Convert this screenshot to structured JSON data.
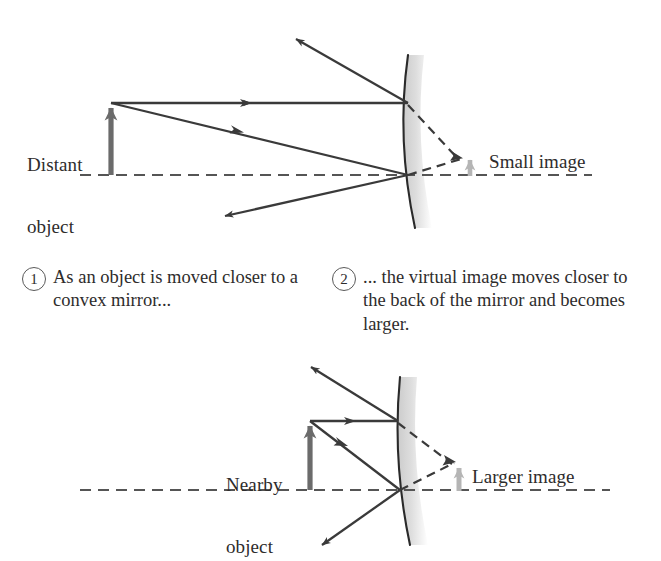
{
  "figure": {
    "kind": "ray-diagram",
    "background_color": "#ffffff"
  },
  "colors": {
    "ray_stroke": "#3a3a3a",
    "virtual_ray_stroke": "#3a3a3a",
    "axis_stroke": "#555555",
    "object_arrow": "#6b6b6b",
    "image_arrow": "#b5b5b5",
    "mirror_line": "#2a2a2a",
    "mirror_band_top": "#d6d6d6",
    "mirror_band_bottom": "#f2f2f2",
    "text": "#2e2c2c"
  },
  "top_panel": {
    "object_label": "Distant\nobject",
    "image_label": "Small image",
    "object_label_line1": "Distant",
    "object_label_line2": "object",
    "mirror_name": "convex-mirror"
  },
  "bottom_panel": {
    "object_label": "Nearby\nobject",
    "image_label": "Larger image",
    "object_label_line1": "Nearby",
    "object_label_line2": "object",
    "mirror_name": "convex-mirror"
  },
  "captions": [
    {
      "number": "1",
      "text": "As an object is moved closer to a convex mirror..."
    },
    {
      "number": "2",
      "text": "... the virtual image moves closer to the back of the mirror and becomes larger."
    }
  ]
}
